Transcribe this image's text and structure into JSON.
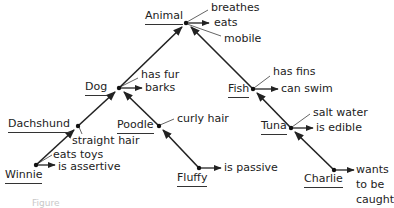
{
  "diagram": {
    "nodes": [
      {
        "id": "animal",
        "label": "Animal",
        "parent": null,
        "properties": [
          "breathes",
          "eats",
          "mobile"
        ]
      },
      {
        "id": "dog",
        "label": "Dog",
        "parent": "animal",
        "properties": [
          "has fur",
          "barks"
        ]
      },
      {
        "id": "fish",
        "label": "Fish",
        "parent": "animal",
        "properties": [
          "has fins",
          "can swim"
        ]
      },
      {
        "id": "dachshund",
        "label": "Dachshund",
        "parent": "dog",
        "properties": [
          "straight hair"
        ]
      },
      {
        "id": "poodle",
        "label": "Poodle",
        "parent": "dog",
        "properties": [
          "curly hair"
        ]
      },
      {
        "id": "tuna",
        "label": "Tuna",
        "parent": "fish",
        "properties": [
          "salt water",
          "is edible"
        ]
      },
      {
        "id": "winnie",
        "label": "Winnie",
        "parent": "dachshund",
        "properties": [
          "eats toys",
          "is assertive"
        ]
      },
      {
        "id": "fluffy",
        "label": "Fluffy",
        "parent": "poodle",
        "properties": [
          "is passive"
        ]
      },
      {
        "id": "charlie",
        "label": "Charlie",
        "parent": "tuna",
        "properties": [
          "wants to be caught"
        ]
      }
    ],
    "labels": {
      "animal": "Animal",
      "animal_breathes": "breathes",
      "animal_eats": "eats",
      "animal_mobile": "mobile",
      "dog": "Dog",
      "dog_fur": "has fur",
      "dog_barks": "barks",
      "fish": "Fish",
      "fish_fins": "has fins",
      "fish_swim": "can swim",
      "dachshund": "Dachshund",
      "dachshund_hair": "straight hair",
      "poodle": "Poodle",
      "poodle_hair": "curly hair",
      "tuna": "Tuna",
      "tuna_salt": "salt water",
      "tuna_edible": "is edible",
      "winnie": "Winnie",
      "winnie_toys": "eats toys",
      "winnie_assertive": "is assertive",
      "fluffy": "Fluffy",
      "fluffy_passive": "is passive",
      "charlie": "Charlie",
      "charlie_wants_1": "wants",
      "charlie_wants_2": "to be",
      "charlie_wants_3": "caught"
    },
    "caption": "Figure",
    "colors": {
      "ink": "#222222",
      "caption": "#c8c8c8"
    }
  }
}
